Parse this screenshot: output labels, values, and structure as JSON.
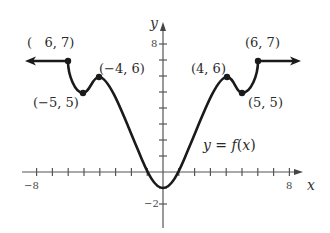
{
  "chart_data": {
    "type": "line",
    "title": "",
    "xlabel": "x",
    "ylabel": "y",
    "function_label": "y = f(x)",
    "xlim": [
      -9,
      9
    ],
    "ylim": [
      -3,
      9
    ],
    "grid": false,
    "x_tick_labels": [
      {
        "value": -8,
        "label": "−8"
      },
      {
        "value": 8,
        "label": "8"
      }
    ],
    "y_tick_labels": [
      {
        "value": 8,
        "label": "8"
      },
      {
        "value": -2,
        "label": "−2"
      }
    ],
    "x_ticks": [
      -8,
      -7,
      -6,
      -5,
      -4,
      -3,
      -2,
      -1,
      1,
      2,
      3,
      4,
      5,
      6,
      7,
      8
    ],
    "y_ticks": [
      -2,
      -1,
      1,
      2,
      3,
      4,
      5,
      6,
      7,
      8
    ],
    "series": [
      {
        "name": "f(x)",
        "x": [
          -8.5,
          -6,
          -5,
          -4,
          0,
          4,
          5,
          6,
          8.5
        ],
        "y": [
          7,
          7,
          5,
          6,
          -1,
          6,
          5,
          7,
          7
        ],
        "left_arrow": true,
        "right_arrow": true
      }
    ],
    "marked_points": [
      {
        "x": -6,
        "y": 7,
        "label": "(   6, 7)"
      },
      {
        "x": -5,
        "y": 5,
        "label": "(−5, 5)"
      },
      {
        "x": -4,
        "y": 6,
        "label": "(−4, 6)"
      },
      {
        "x": 4,
        "y": 6,
        "label": "(4, 6)"
      },
      {
        "x": 5,
        "y": 5,
        "label": "(5, 5)"
      },
      {
        "x": 6,
        "y": 7,
        "label": "(6, 7)"
      }
    ],
    "minimum": {
      "x": 0,
      "y": -1
    }
  },
  "labels": {
    "p_neg6": "(   6, 7)",
    "p_neg5": "(−5, 5)",
    "p_neg4": "(−4, 6)",
    "p_4": "(4, 6)",
    "p_5": "(5, 5)",
    "p_6": "(6, 7)",
    "x_axis": "x",
    "y_axis": "y",
    "x_min_tick": "−8",
    "x_max_tick": "8",
    "y_max_tick": "8",
    "y_min_tick": "−2",
    "fn_y": "y",
    "fn_eq": " = ",
    "fn_f": "f",
    "fn_open": "(",
    "fn_x": "x",
    "fn_close": ")"
  }
}
